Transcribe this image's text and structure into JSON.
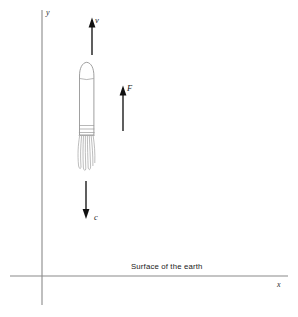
{
  "figure": {
    "background_color": "#ffffff",
    "width": 298,
    "height": 317
  },
  "axes": {
    "y_label": "y",
    "x_label": "x",
    "origin": {
      "x": 42,
      "y": 276
    },
    "y_axis": {
      "x": 42,
      "y_top": 10,
      "y_bottom": 305
    },
    "x_axis": {
      "y": 276,
      "x_left": 10,
      "x_right": 288
    },
    "color": "#8a8a8a"
  },
  "caption": {
    "surface_label": "Surface of the earth"
  },
  "vectors": [
    {
      "name": "velocity",
      "label": "v",
      "direction": "up",
      "x": 92,
      "y_tail": 55,
      "y_head": 18,
      "color": "#111111"
    },
    {
      "name": "thrust-force",
      "label": "F",
      "direction": "up",
      "x": 123,
      "y_tail": 131,
      "y_head": 86,
      "color": "#111111"
    },
    {
      "name": "exhaust-speed",
      "label": "c",
      "direction": "down",
      "x": 86,
      "y_tail": 181,
      "y_head": 219,
      "color": "#111111"
    }
  ],
  "rocket": {
    "name": "rocket",
    "body_left": 79,
    "body_right": 94,
    "nose_top": 62,
    "body_bottom": 135,
    "outline_color": "#8f8f8f",
    "fill_color": "#ffffff",
    "exhaust_color": "#a0a0a0"
  }
}
